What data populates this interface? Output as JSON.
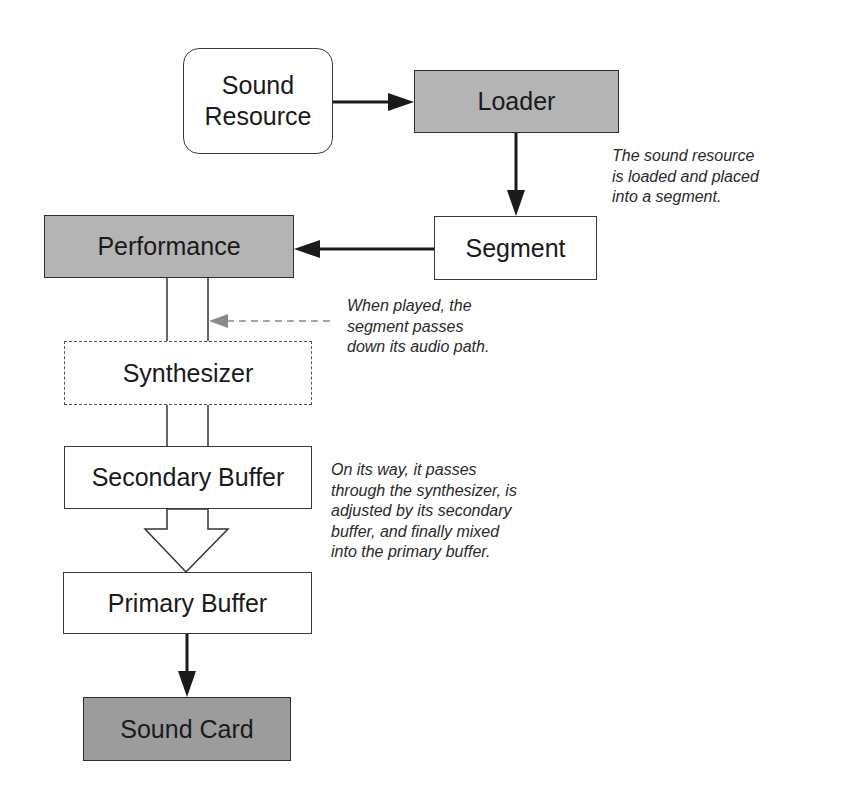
{
  "diagram": {
    "title": "",
    "nodes": [
      {
        "id": "sound_resource",
        "label": "Sound\nResource",
        "style": "rounded"
      },
      {
        "id": "loader",
        "label": "Loader",
        "style": "gray-fill"
      },
      {
        "id": "segment",
        "label": "Segment",
        "style": "plain"
      },
      {
        "id": "performance",
        "label": "Performance",
        "style": "gray-fill"
      },
      {
        "id": "synthesizer",
        "label": "Synthesizer",
        "style": "dashed"
      },
      {
        "id": "secondary_buffer",
        "label": "Secondary Buffer",
        "style": "plain"
      },
      {
        "id": "primary_buffer",
        "label": "Primary Buffer",
        "style": "plain"
      },
      {
        "id": "sound_card",
        "label": "Sound Card",
        "style": "dark-fill"
      }
    ],
    "edges": [
      {
        "from": "sound_resource",
        "to": "loader",
        "type": "arrow"
      },
      {
        "from": "loader",
        "to": "segment",
        "type": "arrow"
      },
      {
        "from": "segment",
        "to": "performance",
        "type": "arrow"
      },
      {
        "from": "performance",
        "to": "synthesizer",
        "type": "pipe"
      },
      {
        "from": "synthesizer",
        "to": "secondary_buffer",
        "type": "pipe"
      },
      {
        "from": "secondary_buffer",
        "to": "primary_buffer",
        "type": "block-arrow"
      },
      {
        "from": "primary_buffer",
        "to": "sound_card",
        "type": "arrow"
      },
      {
        "from": "note_played",
        "to": "performance_pipe",
        "type": "dashed-arrow"
      }
    ],
    "notes": {
      "loaded": "The sound resource\nis loaded and placed\ninto a segment.",
      "played": "When played, the\nsegment passes\ndown its audio path.",
      "way": "On its way, it passes\nthrough the synthesizer, is\nadjusted by its secondary\nbuffer, and finally mixed\ninto the primary buffer."
    },
    "colors": {
      "gray_fill": "#b4b4b4",
      "dark_fill": "#9c9c9c",
      "line": "#1a1a1a",
      "dashed_arrow": "#8a8a8a"
    }
  }
}
